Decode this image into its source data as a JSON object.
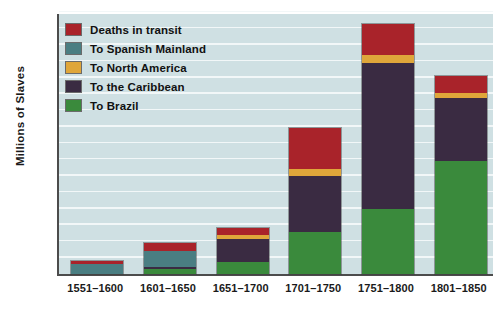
{
  "chart_data": {
    "type": "bar",
    "stacked": true,
    "title": "",
    "xlabel": "",
    "ylabel": "Millions of Slaves",
    "ylim": [
      0,
      4
    ],
    "yticks": [
      1,
      2,
      3,
      4
    ],
    "ytick_labels": [
      "1",
      "2",
      "3",
      "4"
    ],
    "grid": true,
    "grid_interval": 0.25,
    "legend_position": "upper-left-inside",
    "categories": [
      "1551–1600",
      "1601–1650",
      "1651–1700",
      "1701–1750",
      "1751–1800",
      "1801–1850"
    ],
    "series": [
      {
        "name": "To Brazil",
        "color": "#3a8a3c",
        "values": [
          0.0,
          0.07,
          0.18,
          0.64,
          1.0,
          1.73
        ]
      },
      {
        "name": "To the Caribbean",
        "color": "#3a2b42",
        "values": [
          0.0,
          0.04,
          0.36,
          0.85,
          2.22,
          0.95
        ]
      },
      {
        "name": "To North America",
        "color": "#dfa63a",
        "values": [
          0.0,
          0.0,
          0.05,
          0.12,
          0.12,
          0.08
        ]
      },
      {
        "name": "To Spanish Mainland",
        "color": "#4a7e82",
        "values": [
          0.15,
          0.24,
          0.0,
          0.0,
          0.0,
          0.0
        ]
      },
      {
        "name": "Deaths in transit",
        "color": "#a9232a",
        "values": [
          0.05,
          0.12,
          0.12,
          0.62,
          0.48,
          0.27
        ]
      }
    ],
    "totals": [
      0.2,
      0.47,
      0.71,
      2.23,
      3.82,
      3.03
    ]
  },
  "legend": {
    "items": [
      {
        "label": "Deaths in transit",
        "color": "#a9232a",
        "icon": "color-swatch"
      },
      {
        "label": "To Spanish Mainland",
        "color": "#4a7e82",
        "icon": "color-swatch"
      },
      {
        "label": "To North America",
        "color": "#dfa63a",
        "icon": "color-swatch"
      },
      {
        "label": "To the Caribbean",
        "color": "#3a2b42",
        "icon": "color-swatch"
      },
      {
        "label": "To Brazil",
        "color": "#3a8a3c",
        "icon": "color-swatch"
      }
    ]
  },
  "axis": {
    "y_title": "Millions of Slaves",
    "y_tick_labels": [
      "4",
      "3",
      "2",
      "1"
    ],
    "x_tick_labels": [
      "1551–1600",
      "1601–1650",
      "1651–1700",
      "1701–1750",
      "1751–1800",
      "1801–1850"
    ]
  },
  "colors": {
    "plot_background": "#cfe0e3",
    "gridline": "#f2f7f8",
    "axis_line": "#4c4c4c",
    "page_background": "#ffffff"
  },
  "caption": ""
}
